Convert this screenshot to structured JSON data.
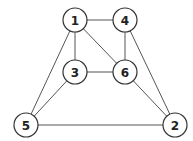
{
  "diagram": {
    "type": "undirected-graph",
    "nodes": [
      {
        "id": "1",
        "label": "1",
        "x": 75,
        "y": 20
      },
      {
        "id": "4",
        "label": "4",
        "x": 125,
        "y": 20
      },
      {
        "id": "3",
        "label": "3",
        "x": 75,
        "y": 72
      },
      {
        "id": "6",
        "label": "6",
        "x": 125,
        "y": 72
      },
      {
        "id": "5",
        "label": "5",
        "x": 26,
        "y": 125
      },
      {
        "id": "2",
        "label": "2",
        "x": 175,
        "y": 125
      }
    ],
    "edges": [
      [
        "1",
        "4"
      ],
      [
        "1",
        "3"
      ],
      [
        "1",
        "6"
      ],
      [
        "1",
        "5"
      ],
      [
        "4",
        "6"
      ],
      [
        "4",
        "2"
      ],
      [
        "3",
        "6"
      ],
      [
        "3",
        "5"
      ],
      [
        "6",
        "2"
      ],
      [
        "5",
        "2"
      ]
    ]
  }
}
